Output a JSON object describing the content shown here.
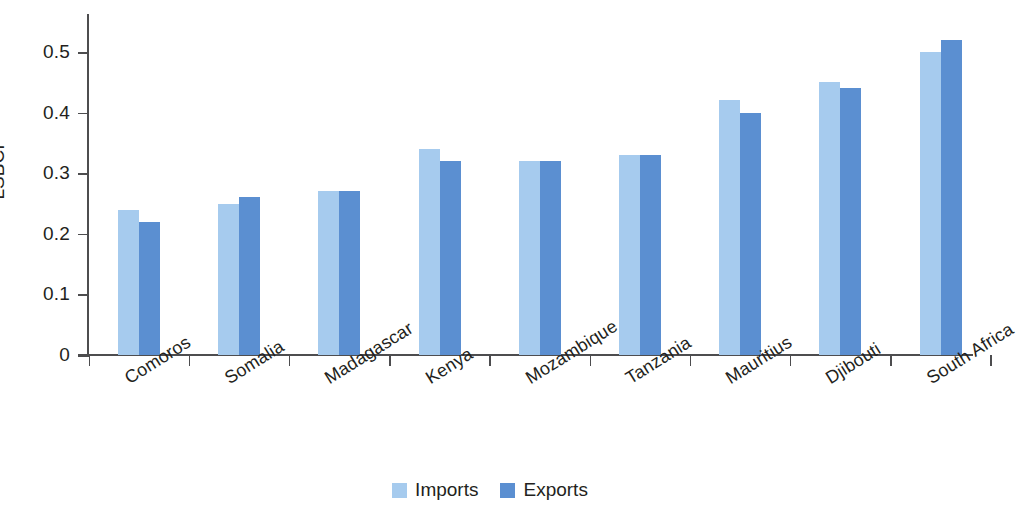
{
  "chart_data": {
    "type": "bar",
    "title": "",
    "subtitle": "",
    "xlabel": "",
    "ylabel": "LSBCI",
    "ylim": [
      0,
      0.56
    ],
    "yticks": [
      0,
      0.1,
      0.2,
      0.3,
      0.4,
      0.5
    ],
    "ytick_labels": [
      "0",
      "0.1",
      "0.2",
      "0.3",
      "0.4",
      "0.5"
    ],
    "grid": false,
    "legend_position": "bottom-center",
    "categories": [
      "Comoros",
      "Somalia",
      "Madagascar",
      "Kenya",
      "Mozambique",
      "Tanzania",
      "Mauritius",
      "Djibouti",
      "South Africa"
    ],
    "series": [
      {
        "name": "Imports",
        "color": "#a6cbee",
        "values": [
          0.24,
          0.25,
          0.27,
          0.34,
          0.32,
          0.33,
          0.42,
          0.45,
          0.5
        ]
      },
      {
        "name": "Exports",
        "color": "#5b8fd1",
        "values": [
          0.22,
          0.26,
          0.27,
          0.32,
          0.32,
          0.33,
          0.4,
          0.44,
          0.52
        ]
      }
    ]
  },
  "legend": {
    "items": [
      {
        "label": "Imports",
        "color": "#a6cbee"
      },
      {
        "label": "Exports",
        "color": "#5b8fd1"
      }
    ]
  },
  "axes": {
    "y_title": "LSBCI"
  }
}
